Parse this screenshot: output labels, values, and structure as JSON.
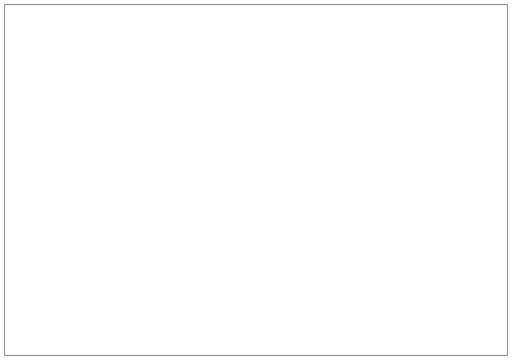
{
  "chart_data": {
    "type": "line",
    "title": "",
    "xlabel": "",
    "ylabel": "PERCENT OF GROUP IN POVERTY",
    "xlim": [
      1958,
      1986
    ],
    "ylim": [
      0,
      40
    ],
    "grid": false,
    "legend_position": "inline-annotations",
    "x_major_ticks": [
      1958,
      1962,
      1966,
      1970,
      1974,
      1978,
      1982,
      1986
    ],
    "x_minor_ticks": [
      1960,
      1964,
      1968,
      1972,
      1976,
      1980,
      1984
    ],
    "x_tick_labels": [
      "1958",
      "1962",
      "1966",
      "1970",
      "1974",
      "1978",
      "1982",
      "1986"
    ],
    "y_ticks": [
      5,
      10,
      15,
      20,
      25,
      30,
      35,
      40
    ],
    "y_tick_labels": [
      "5",
      "10",
      "15",
      "20",
      "25",
      "30",
      "35",
      "40"
    ],
    "series": [
      {
        "name": "Persons aged 65 and Over",
        "style": "solid",
        "label_text_line1": "Persons aged 65 and Over",
        "label_text_line2": "",
        "x": [
          1959,
          1960,
          1961,
          1962,
          1963,
          1964,
          1965,
          1966,
          1967,
          1968,
          1969,
          1970,
          1971,
          1972,
          1973,
          1974,
          1975,
          1976,
          1977,
          1978,
          1979,
          1980,
          1981,
          1982,
          1983,
          1984
        ],
        "values": [
          35.2,
          34.4,
          33.6,
          32.8,
          32.0,
          31.2,
          30.4,
          29.6,
          28.8,
          27.9,
          26.4,
          24.8,
          21.9,
          19.0,
          16.9,
          15.2,
          15.4,
          15.9,
          15.2,
          14.8,
          14.8,
          15.1,
          16.5,
          16.1,
          15.7,
          13.4
        ]
      },
      {
        "name": "Children Under Age 18",
        "style": "dashed",
        "label_text_line1": "Children Under",
        "label_text_line2": "Age 18",
        "x": [
          1959,
          1960,
          1961,
          1962,
          1963,
          1964,
          1965,
          1966,
          1967,
          1968,
          1969,
          1970,
          1971,
          1972,
          1973,
          1974,
          1975,
          1976,
          1977,
          1978,
          1979,
          1980,
          1981,
          1982,
          1983,
          1984
        ],
        "values": [
          26.8,
          25.8,
          24.8,
          23.7,
          22.6,
          21.5,
          20.4,
          19.2,
          17.9,
          16.6,
          14.0,
          15.2,
          15.5,
          15.3,
          14.8,
          15.1,
          17.2,
          16.3,
          16.5,
          16.5,
          16.6,
          18.6,
          20.4,
          22.1,
          22.5,
          21.7
        ]
      },
      {
        "name": "All Persons in the Population",
        "style": "dash-dot",
        "label_text_line1": "All Persons in",
        "label_text_line2": "the Population",
        "x": [
          1959,
          1960,
          1961,
          1962,
          1963,
          1964,
          1965,
          1966,
          1967,
          1968,
          1969,
          1970,
          1971,
          1972,
          1973,
          1974,
          1975,
          1976,
          1977,
          1978,
          1979,
          1980,
          1981,
          1982,
          1983,
          1984
        ],
        "values": [
          22.3,
          21.4,
          20.6,
          19.8,
          19.0,
          18.0,
          17.0,
          15.8,
          14.6,
          13.4,
          12.4,
          12.7,
          12.6,
          12.0,
          11.5,
          11.8,
          12.2,
          15.2,
          12.4,
          12.3,
          12.4,
          13.1,
          14.2,
          15.6,
          16.0,
          15.4
        ]
      }
    ]
  }
}
